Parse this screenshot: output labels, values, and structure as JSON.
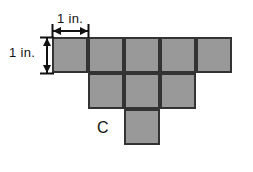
{
  "figure": {
    "background_color": "#ffffff",
    "square_fill_color": "#999999",
    "square_border_color": "#333333",
    "label_color": "#111111",
    "unit_size_px": 36,
    "width_px": 253,
    "height_px": 172
  },
  "dimensions": {
    "horizontal": {
      "label": "1 in.",
      "value": 1,
      "unit": "in.",
      "orientation": "horizontal",
      "spans_px": {
        "x1": 52,
        "x2": 88,
        "y": 30
      },
      "label_pos_px": {
        "x": 57,
        "y": 12
      }
    },
    "vertical": {
      "label": "1 in.",
      "value": 1,
      "unit": "in.",
      "orientation": "vertical",
      "spans_px": {
        "y1": 37,
        "y2": 73,
        "x": 46
      },
      "label_pos_px": {
        "x": 9,
        "y": 46
      }
    }
  },
  "region_labels": [
    {
      "text": "C",
      "x_px": 97,
      "y_px": 120
    }
  ],
  "grid": {
    "origin_px": {
      "x": 52,
      "y": 37
    },
    "cell_px": 36,
    "rows": [
      {
        "row": 0,
        "y_px": 37,
        "columns": [
          0,
          1,
          2,
          3,
          4
        ],
        "count": 5
      },
      {
        "row": 1,
        "y_px": 73,
        "columns": [
          1,
          2,
          3
        ],
        "count": 3
      },
      {
        "row": 2,
        "y_px": 109,
        "columns": [
          2
        ],
        "count": 1
      }
    ],
    "total_squares": 9
  },
  "squares": [
    {
      "id": "r0c0",
      "x": 52,
      "y": 37,
      "w": 36,
      "h": 36
    },
    {
      "id": "r0c1",
      "x": 88,
      "y": 37,
      "w": 36,
      "h": 36
    },
    {
      "id": "r0c2",
      "x": 124,
      "y": 37,
      "w": 36,
      "h": 36
    },
    {
      "id": "r0c3",
      "x": 160,
      "y": 37,
      "w": 36,
      "h": 36
    },
    {
      "id": "r0c4",
      "x": 196,
      "y": 37,
      "w": 36,
      "h": 36
    },
    {
      "id": "r1c1",
      "x": 88,
      "y": 73,
      "w": 36,
      "h": 36
    },
    {
      "id": "r1c2",
      "x": 124,
      "y": 73,
      "w": 36,
      "h": 36
    },
    {
      "id": "r1c3",
      "x": 160,
      "y": 73,
      "w": 36,
      "h": 36
    },
    {
      "id": "r2c2",
      "x": 124,
      "y": 109,
      "w": 36,
      "h": 36
    }
  ]
}
